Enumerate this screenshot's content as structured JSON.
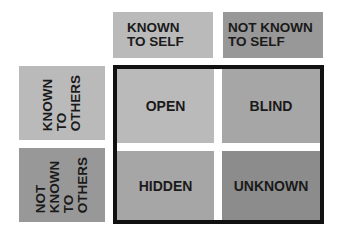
{
  "colors": {
    "light": "#bababa",
    "medium": "#a6a6a6",
    "dark": "#989898",
    "darkest": "#8c8c8c",
    "frame": "#111111"
  },
  "columns": [
    {
      "label": "KNOWN\nTO SELF"
    },
    {
      "label": "NOT KNOWN\nTO SELF"
    }
  ],
  "rows": [
    {
      "label": "KNOWN\nTO\nOTHERS"
    },
    {
      "label": "NOT\nKNOWN\nTO\nOTHERS"
    }
  ],
  "quadrants": [
    {
      "label": "OPEN"
    },
    {
      "label": "BLIND"
    },
    {
      "label": "HIDDEN"
    },
    {
      "label": "UNKNOWN"
    }
  ]
}
